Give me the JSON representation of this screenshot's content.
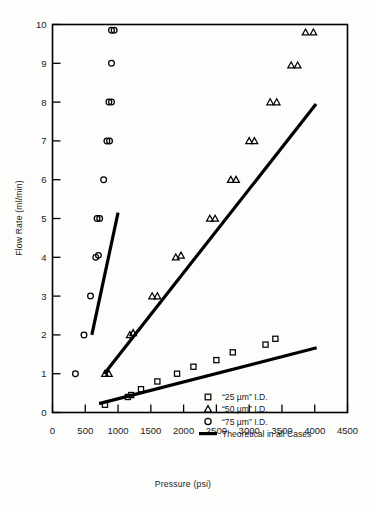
{
  "figure": {
    "kind": "scientific-scatter-plot",
    "background": "#fdfdfb",
    "ink_color": "#000000"
  },
  "axes": {
    "x": {
      "title": "Pressure (psi)",
      "min": 0,
      "max": 4500,
      "step": 500,
      "ticks": [
        "0",
        "500",
        "1000",
        "1500",
        "2000",
        "2500",
        "3000",
        "3500",
        "4000",
        "4500"
      ]
    },
    "y": {
      "title": "Flow Rate (ml/min)",
      "min": 0,
      "max": 10,
      "step": 1,
      "ticks": [
        "0",
        "1",
        "2",
        "3",
        "4",
        "5",
        "6",
        "7",
        "8",
        "9",
        "10"
      ]
    }
  },
  "legend": {
    "position": "lower-right-inside",
    "entries": [
      {
        "marker": "square-marker",
        "label": "“25 µm” I.D."
      },
      {
        "marker": "triangle-marker",
        "label": "“50 µm” I.D."
      },
      {
        "marker": "circle-marker",
        "label": "“75 µm” I.D."
      },
      {
        "marker": "line-marker",
        "label": "Theoretical in all Cases"
      }
    ]
  },
  "chart_data": {
    "type": "scatter",
    "title": "",
    "xlabel": "Pressure (psi)",
    "ylabel": "Flow Rate (ml/min)",
    "xlim": [
      0,
      4500
    ],
    "ylim": [
      0,
      10
    ],
    "grid": false,
    "legend_position": "lower right",
    "series": [
      {
        "name": "“25 µm” I.D.",
        "marker": "square",
        "points": [
          [
            800,
            0.2
          ],
          [
            1150,
            0.4
          ],
          [
            1200,
            0.45
          ],
          [
            1350,
            0.6
          ],
          [
            1600,
            0.8
          ],
          [
            1900,
            1.0
          ],
          [
            2150,
            1.18
          ],
          [
            2500,
            1.35
          ],
          [
            2750,
            1.55
          ],
          [
            3250,
            1.75
          ],
          [
            3400,
            1.9
          ]
        ]
      },
      {
        "name": "“50 µm” I.D.",
        "marker": "triangle",
        "points": [
          [
            800,
            1.0
          ],
          [
            860,
            1.0
          ],
          [
            1180,
            2.0
          ],
          [
            1230,
            2.05
          ],
          [
            1520,
            3.0
          ],
          [
            1600,
            3.0
          ],
          [
            1880,
            4.0
          ],
          [
            1960,
            4.05
          ],
          [
            2400,
            5.0
          ],
          [
            2480,
            5.0
          ],
          [
            2720,
            6.0
          ],
          [
            2800,
            6.0
          ],
          [
            3000,
            7.0
          ],
          [
            3080,
            7.0
          ],
          [
            3320,
            8.0
          ],
          [
            3420,
            8.0
          ],
          [
            3640,
            8.95
          ],
          [
            3740,
            8.95
          ],
          [
            3860,
            9.8
          ],
          [
            3980,
            9.8
          ]
        ]
      },
      {
        "name": "“75 µm” I.D.",
        "marker": "circle",
        "points": [
          [
            350,
            1.0
          ],
          [
            480,
            2.0
          ],
          [
            580,
            3.0
          ],
          [
            660,
            4.0
          ],
          [
            700,
            4.05
          ],
          [
            680,
            5.0
          ],
          [
            720,
            5.0
          ],
          [
            780,
            6.0
          ],
          [
            830,
            7.0
          ],
          [
            870,
            7.0
          ],
          [
            860,
            8.0
          ],
          [
            900,
            8.0
          ],
          [
            900,
            9.0
          ],
          [
            900,
            9.85
          ],
          [
            940,
            9.85
          ]
        ]
      }
    ],
    "theoretical_lines": [
      {
        "name": "Theoretical “75 µm”",
        "x": [
          600,
          1000
        ],
        "y": [
          2.0,
          5.15
        ]
      },
      {
        "name": "Theoretical “50 µm”",
        "x": [
          790,
          4020
        ],
        "y": [
          1.0,
          7.95
        ]
      },
      {
        "name": "Theoretical “25 µm”",
        "x": [
          710,
          4030
        ],
        "y": [
          0.23,
          1.67
        ]
      }
    ]
  }
}
